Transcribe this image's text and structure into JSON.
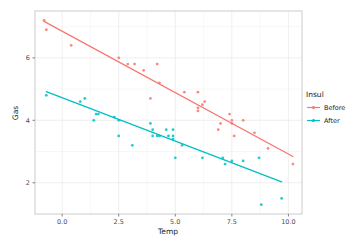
{
  "chart_data": {
    "type": "scatter",
    "title": "",
    "xlabel": "Temp",
    "ylabel": "Gas",
    "xlim": [
      -1.2,
      10.6
    ],
    "ylim": [
      1.0,
      7.5
    ],
    "x_ticks": {
      "values": [
        0,
        2.5,
        5,
        7.5,
        10
      ],
      "labels": [
        "0.0",
        "2.5",
        "5.0",
        "7.5",
        "10.0"
      ]
    },
    "y_ticks": {
      "values": [
        2,
        4,
        6
      ],
      "labels": [
        "2",
        "4",
        "6"
      ]
    },
    "grid": true,
    "legend": {
      "title": "Insul",
      "position": "right",
      "entries": [
        {
          "label": "Before",
          "color": "#F8766D"
        },
        {
          "label": "After",
          "color": "#00BFC4"
        }
      ]
    },
    "series": [
      {
        "name": "Before",
        "color": "#F8766D",
        "points": [
          [
            -0.8,
            7.2
          ],
          [
            -0.7,
            6.9
          ],
          [
            0.4,
            6.4
          ],
          [
            2.5,
            6.0
          ],
          [
            2.9,
            5.8
          ],
          [
            3.2,
            5.8
          ],
          [
            3.6,
            5.6
          ],
          [
            3.9,
            4.7
          ],
          [
            4.2,
            5.8
          ],
          [
            4.3,
            5.2
          ],
          [
            5.4,
            4.9
          ],
          [
            6.0,
            4.9
          ],
          [
            6.0,
            4.3
          ],
          [
            6.0,
            4.4
          ],
          [
            6.2,
            4.5
          ],
          [
            6.3,
            4.6
          ],
          [
            6.9,
            3.7
          ],
          [
            7.0,
            3.9
          ],
          [
            7.4,
            4.2
          ],
          [
            7.5,
            4.0
          ],
          [
            7.5,
            3.9
          ],
          [
            7.6,
            3.5
          ],
          [
            8.0,
            4.0
          ],
          [
            8.5,
            3.6
          ],
          [
            9.1,
            3.1
          ],
          [
            10.2,
            2.6
          ]
        ],
        "trend": {
          "x": [
            -0.8,
            10.2
          ],
          "y": [
            7.17,
            2.84
          ]
        }
      },
      {
        "name": "After",
        "color": "#00BFC4",
        "points": [
          [
            -0.7,
            4.8
          ],
          [
            0.8,
            4.6
          ],
          [
            1.0,
            4.7
          ],
          [
            1.4,
            4.0
          ],
          [
            1.5,
            4.2
          ],
          [
            1.6,
            4.2
          ],
          [
            2.3,
            4.1
          ],
          [
            2.5,
            4.0
          ],
          [
            2.5,
            3.5
          ],
          [
            3.1,
            3.2
          ],
          [
            3.9,
            3.9
          ],
          [
            4.0,
            3.5
          ],
          [
            4.0,
            3.7
          ],
          [
            4.2,
            3.5
          ],
          [
            4.3,
            3.5
          ],
          [
            4.6,
            3.7
          ],
          [
            4.7,
            3.5
          ],
          [
            4.9,
            3.4
          ],
          [
            4.9,
            3.7
          ],
          [
            4.9,
            3.5
          ],
          [
            5.0,
            2.8
          ],
          [
            5.3,
            3.2
          ],
          [
            6.2,
            2.8
          ],
          [
            7.1,
            2.8
          ],
          [
            7.2,
            2.6
          ],
          [
            7.5,
            2.7
          ],
          [
            8.0,
            2.7
          ],
          [
            8.7,
            2.8
          ],
          [
            8.8,
            1.3
          ],
          [
            9.7,
            1.5
          ]
        ],
        "trend": {
          "x": [
            -0.7,
            9.7
          ],
          "y": [
            4.92,
            2.03
          ]
        }
      }
    ]
  },
  "style_colors": {
    "background": "#ffffff",
    "panel_border": "#cccccc",
    "grid_major": "#ebebeb",
    "grid_minor": "#f4f4f4",
    "axis_text": "#4d4d4d",
    "tick_mark": "#666666"
  }
}
